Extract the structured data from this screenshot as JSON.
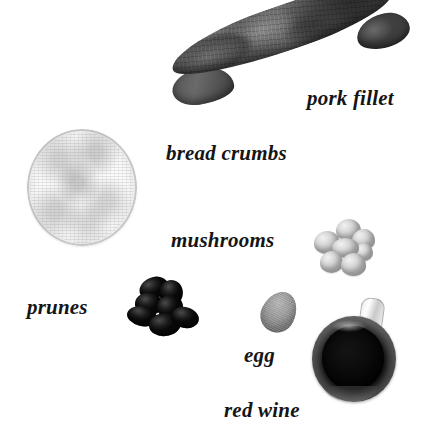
{
  "page": {
    "background_color": "#ffffff",
    "width": 431,
    "height": 426,
    "style": "black-and-white photographic ingredient layout with handwritten-style italic serif captions"
  },
  "labels": {
    "pork_fillet": "pork fillet",
    "bread_crumbs": "bread crumbs",
    "mushrooms": "mushrooms",
    "prunes": "prunes",
    "egg": "egg",
    "red_wine": "red wine"
  },
  "items": [
    {
      "id": "pork-fillet",
      "label": "pork fillet",
      "icon": "pork-fillet-photo",
      "description": "long diagonal raw pork tenderloin, dark grey, upper right",
      "color": "#4f4f4f"
    },
    {
      "id": "bread-crumbs",
      "label": "bread crumbs",
      "icon": "bread-crumbs-photo",
      "description": "round shallow dish filled with pale speckled crumbs, left side",
      "color": "#ededed"
    },
    {
      "id": "mushrooms",
      "label": "mushrooms",
      "icon": "mushrooms-photo",
      "description": "cluster of small white button mushrooms, right of centre",
      "color": "#d8d8d8"
    },
    {
      "id": "prunes",
      "label": "prunes",
      "icon": "prunes-photo",
      "description": "heap of very dark wrinkled prunes, lower left of centre",
      "color": "#151515"
    },
    {
      "id": "egg",
      "label": "egg",
      "icon": "egg-photo",
      "description": "single grey oval egg, lower centre",
      "color": "#9d9d9d"
    },
    {
      "id": "red-wine",
      "label": "red wine",
      "icon": "wine-glass-photo",
      "description": "wine glass seen from above, dark pool of red wine in the bowl, lower right",
      "color": "#0a0a0a"
    }
  ]
}
